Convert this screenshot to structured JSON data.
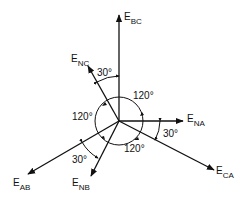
{
  "diagram": {
    "origin": [
      119,
      121
    ],
    "vectors": [
      {
        "id": "E_BC",
        "main": "E",
        "sub": "BC",
        "angle_deg": 90,
        "tip": [
          119,
          15
        ]
      },
      {
        "id": "E_NC",
        "main": "E",
        "sub": "NC",
        "angle_deg": 120,
        "tip": [
          88,
          66
        ]
      },
      {
        "id": "E_NA",
        "main": "E",
        "sub": "NA",
        "angle_deg": 0,
        "tip": [
          183,
          121
        ]
      },
      {
        "id": "E_CA",
        "main": "E",
        "sub": "CA",
        "angle_deg": -30,
        "tip": [
          214,
          170
        ]
      },
      {
        "id": "E_AB",
        "main": "E",
        "sub": "AB",
        "angle_deg": 210,
        "tip": [
          28,
          174
        ]
      },
      {
        "id": "E_NB",
        "main": "E",
        "sub": "NB",
        "angle_deg": 240,
        "tip": [
          91,
          176
        ]
      }
    ],
    "angles": [
      {
        "label": "30°",
        "between": [
          "E_NC",
          "E_BC"
        ]
      },
      {
        "label": "120°",
        "between": [
          "E_BC-region",
          "E_NA"
        ],
        "position": "upper-right"
      },
      {
        "label": "120°",
        "position": "left"
      },
      {
        "label": "120°",
        "position": "lower-right"
      },
      {
        "label": "30°",
        "between": [
          "E_NA",
          "E_CA"
        ]
      },
      {
        "label": "30°",
        "between": [
          "E_AB",
          "E_NB"
        ]
      }
    ],
    "circle_radius": 24,
    "stroke_color": "#111111",
    "background": "#ffffff"
  }
}
